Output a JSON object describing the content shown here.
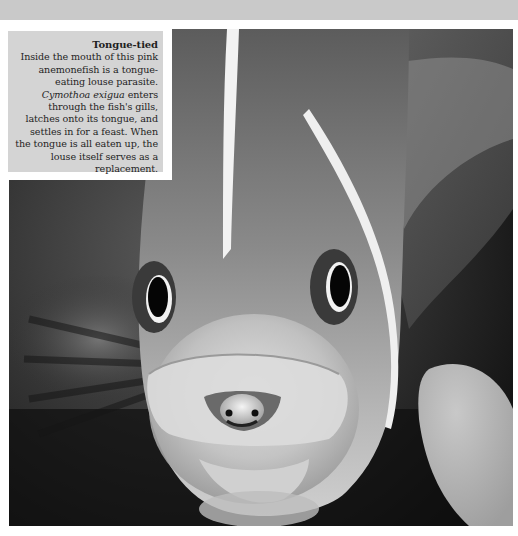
{
  "caption": {
    "title": "Tongue-tied",
    "body_part1": "Inside the mouth of this pink anemonefish is a tongue-eating louse parasite.",
    "species_name": "Cymothoa exigua",
    "body_part2": "enters through the fish's gills, latches onto its tongue, and settles in for a feast. When the tongue is all eaten up, the louse itself serves as a replacement."
  },
  "photo": {
    "subject": "pink anemonefish with tongue-eating louse in mouth",
    "tone": "grayscale",
    "colors": {
      "background_dark": "#1a1a1a",
      "fish_body": "#8c8c8c",
      "fish_face_light": "#d8d8d8",
      "stripe": "#f2f2f2",
      "eye_pupil": "#050505",
      "caption_box": "#d4d4d4",
      "top_band": "#c9c9c9"
    }
  }
}
